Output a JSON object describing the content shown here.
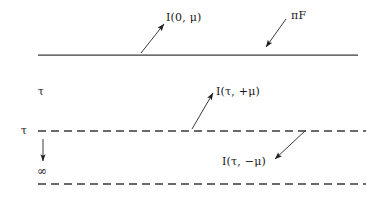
{
  "figure": {
    "background_color": "#ffffff",
    "line_color": "#3a3a3e",
    "text_color": "#16161a",
    "width": 386,
    "height": 200
  },
  "labels": {
    "intensity_surface_out": "I(0, μ)",
    "incident_flux": "πF",
    "intensity_up": "I(τ, +μ)",
    "intensity_down": "I(τ, −μ)",
    "tau_upper": "τ",
    "tau_level": "τ",
    "tau_infinity": "∞"
  },
  "lines": [
    {
      "name": "surface-boundary-line",
      "style": "solid",
      "x1": 38,
      "y1": 55,
      "x2": 358,
      "y2": 55
    },
    {
      "name": "tau-level-line",
      "style": "dashed",
      "x1": 38,
      "y1": 131,
      "x2": 366,
      "y2": 131
    },
    {
      "name": "lower-boundary-line",
      "style": "dashed",
      "x1": 38,
      "y1": 184,
      "x2": 366,
      "y2": 184
    }
  ],
  "arrows": [
    {
      "name": "arrow-intensity-surface-out",
      "direction": "up-right",
      "x1": 141,
      "y1": 53,
      "x2": 164,
      "y2": 24
    },
    {
      "name": "arrow-incident-flux",
      "direction": "down-left",
      "x1": 286,
      "y1": 19,
      "x2": 266,
      "y2": 47
    },
    {
      "name": "arrow-intensity-up",
      "direction": "up-right",
      "x1": 192,
      "y1": 129,
      "x2": 213,
      "y2": 93
    },
    {
      "name": "arrow-intensity-down",
      "direction": "down-left",
      "x1": 306,
      "y1": 130,
      "x2": 275,
      "y2": 159
    },
    {
      "name": "arrow-depth-direction",
      "direction": "down",
      "x1": 43,
      "y1": 139,
      "x2": 43,
      "y2": 161
    }
  ],
  "dash_pattern": {
    "dash_length": 8,
    "gap_length": 5
  }
}
